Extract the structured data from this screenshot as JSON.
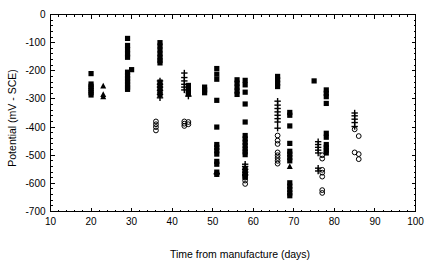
{
  "chart_data": {
    "type": "scatter",
    "title": "",
    "xlabel": "Time from manufacture (days)",
    "ylabel": "Potential (mV - SCE)",
    "xlim": [
      10,
      100
    ],
    "ylim": [
      -700,
      0
    ],
    "xticks": [
      10,
      20,
      30,
      40,
      50,
      60,
      70,
      80,
      90,
      100
    ],
    "yticks": [
      0,
      -100,
      -200,
      -300,
      -400,
      -500,
      -600,
      -700
    ],
    "xtick_labels": [
      "10",
      "20",
      "30",
      "40",
      "50",
      "60",
      "70",
      "80",
      "90",
      "100"
    ],
    "ytick_labels": [
      "0",
      "-100",
      "-200",
      "-300",
      "-400",
      "-500",
      "-600",
      "-700"
    ],
    "grid": false,
    "legend": "none",
    "frame": "box",
    "marker_colors": {
      "filled_square": "#000000",
      "filled_triangle": "#000000",
      "open_circle": "#000000",
      "plus": "#000000"
    },
    "series": [
      {
        "name": "filled-square",
        "marker": "square",
        "points": [
          [
            20,
            -210
          ],
          [
            20,
            -247
          ],
          [
            20,
            -255
          ],
          [
            20,
            -262
          ],
          [
            20,
            -270
          ],
          [
            20,
            -278
          ],
          [
            20,
            -286
          ],
          [
            29,
            -85
          ],
          [
            29,
            -110
          ],
          [
            29,
            -125
          ],
          [
            29,
            -140
          ],
          [
            29,
            -152
          ],
          [
            29,
            -205
          ],
          [
            29,
            -218
          ],
          [
            29,
            -228
          ],
          [
            29,
            -238
          ],
          [
            29,
            -248
          ],
          [
            29,
            -258
          ],
          [
            29,
            -266
          ],
          [
            30,
            -196
          ],
          [
            37,
            -100
          ],
          [
            37,
            -112
          ],
          [
            37,
            -126
          ],
          [
            37,
            -140
          ],
          [
            37,
            -152
          ],
          [
            37,
            -163
          ],
          [
            37,
            -172
          ],
          [
            37,
            -240
          ],
          [
            37,
            -252
          ],
          [
            37,
            -262
          ],
          [
            37,
            -272
          ],
          [
            37,
            -284
          ],
          [
            44,
            -252
          ],
          [
            44,
            -262
          ],
          [
            44,
            -272
          ],
          [
            44,
            -282
          ],
          [
            48,
            -258
          ],
          [
            48,
            -268
          ],
          [
            48,
            -278
          ],
          [
            51,
            -192
          ],
          [
            51,
            -212
          ],
          [
            51,
            -230
          ],
          [
            51,
            -305
          ],
          [
            51,
            -400
          ],
          [
            51,
            -462
          ],
          [
            51,
            -472
          ],
          [
            51,
            -484
          ],
          [
            51,
            -496
          ],
          [
            51,
            -522
          ],
          [
            51,
            -532
          ],
          [
            51,
            -560
          ],
          [
            51,
            -568
          ],
          [
            56,
            -232
          ],
          [
            56,
            -244
          ],
          [
            56,
            -258
          ],
          [
            56,
            -272
          ],
          [
            56,
            -284
          ],
          [
            58,
            -234
          ],
          [
            58,
            -250
          ],
          [
            58,
            -276
          ],
          [
            58,
            -318
          ],
          [
            58,
            -382
          ],
          [
            58,
            -430
          ],
          [
            58,
            -442
          ],
          [
            58,
            -454
          ],
          [
            58,
            -466
          ],
          [
            58,
            -478
          ],
          [
            58,
            -488
          ],
          [
            58,
            -498
          ],
          [
            58,
            -548
          ],
          [
            58,
            -558
          ],
          [
            58,
            -568
          ],
          [
            58,
            -578
          ],
          [
            66,
            -220
          ],
          [
            66,
            -232
          ],
          [
            66,
            -244
          ],
          [
            66,
            -256
          ],
          [
            69,
            -348
          ],
          [
            69,
            -358
          ],
          [
            69,
            -396
          ],
          [
            69,
            -458
          ],
          [
            69,
            -486
          ],
          [
            69,
            -496
          ],
          [
            69,
            -508
          ],
          [
            69,
            -520
          ],
          [
            69,
            -598
          ],
          [
            69,
            -610
          ],
          [
            69,
            -622
          ],
          [
            69,
            -634
          ],
          [
            69,
            -644
          ],
          [
            75,
            -236
          ],
          [
            78,
            -268
          ],
          [
            78,
            -280
          ],
          [
            78,
            -292
          ],
          [
            78,
            -316
          ],
          [
            78,
            -422
          ],
          [
            78,
            -436
          ],
          [
            78,
            -462
          ],
          [
            78,
            -472
          ],
          [
            78,
            -482
          ],
          [
            78,
            -492
          ]
        ]
      },
      {
        "name": "filled-triangle",
        "marker": "triangle",
        "points": [
          [
            23,
            -254
          ],
          [
            23,
            -284
          ],
          [
            23,
            -292
          ],
          [
            58,
            -564
          ],
          [
            69,
            -540
          ]
        ]
      },
      {
        "name": "plus",
        "marker": "plus",
        "points": [
          [
            37,
            -236
          ],
          [
            37,
            -248
          ],
          [
            37,
            -258
          ],
          [
            37,
            -270
          ],
          [
            37,
            -284
          ],
          [
            37,
            -296
          ],
          [
            43,
            -208
          ],
          [
            43,
            -224
          ],
          [
            43,
            -236
          ],
          [
            43,
            -248
          ],
          [
            43,
            -258
          ],
          [
            43,
            -268
          ],
          [
            44,
            -290
          ],
          [
            51,
            -566
          ],
          [
            58,
            -532
          ],
          [
            58,
            -540
          ],
          [
            58,
            -550
          ],
          [
            58,
            -560
          ],
          [
            58,
            -570
          ],
          [
            66,
            -308
          ],
          [
            66,
            -322
          ],
          [
            66,
            -334
          ],
          [
            66,
            -346
          ],
          [
            66,
            -358
          ],
          [
            66,
            -370
          ],
          [
            66,
            -382
          ],
          [
            66,
            -404
          ],
          [
            76,
            -452
          ],
          [
            76,
            -462
          ],
          [
            76,
            -472
          ],
          [
            76,
            -482
          ],
          [
            76,
            -492
          ],
          [
            76,
            -546
          ],
          [
            76,
            -556
          ],
          [
            85,
            -350
          ],
          [
            85,
            -360
          ],
          [
            85,
            -372
          ],
          [
            85,
            -384
          ],
          [
            85,
            -398
          ]
        ]
      },
      {
        "name": "open-circle",
        "marker": "circle",
        "points": [
          [
            36,
            -380
          ],
          [
            36,
            -390
          ],
          [
            36,
            -400
          ],
          [
            36,
            -412
          ],
          [
            43,
            -380
          ],
          [
            43,
            -388
          ],
          [
            43,
            -396
          ],
          [
            44,
            -382
          ],
          [
            44,
            -390
          ],
          [
            58,
            -570
          ],
          [
            58,
            -580
          ],
          [
            58,
            -590
          ],
          [
            58,
            -602
          ],
          [
            66,
            -430
          ],
          [
            66,
            -448
          ],
          [
            66,
            -460
          ],
          [
            66,
            -490
          ],
          [
            66,
            -500
          ],
          [
            66,
            -510
          ],
          [
            66,
            -520
          ],
          [
            66,
            -530
          ],
          [
            77,
            -500
          ],
          [
            77,
            -512
          ],
          [
            77,
            -552
          ],
          [
            77,
            -562
          ],
          [
            77,
            -576
          ],
          [
            77,
            -624
          ],
          [
            77,
            -634
          ],
          [
            85,
            -408
          ],
          [
            86,
            -432
          ],
          [
            85,
            -490
          ],
          [
            86,
            -496
          ],
          [
            86,
            -514
          ]
        ]
      }
    ]
  }
}
